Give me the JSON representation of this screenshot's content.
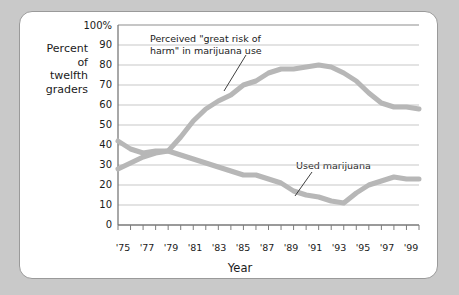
{
  "figure": {
    "card_background": "#ffffff",
    "outer_background": "#c9c9c9",
    "border_color": "#9a9a9a"
  },
  "axis": {
    "y_title": "Percent\nof\ntwelfth\ngraders",
    "x_title": "Year",
    "y_tick_labels": [
      "100%",
      "90",
      "80",
      "70",
      "60",
      "50",
      "40",
      "30",
      "20",
      "10",
      "0"
    ],
    "x_tick_labels": [
      "'75",
      "'77",
      "'79",
      "'81",
      "'83",
      "'85",
      "'87",
      "'89",
      "'91",
      "'93",
      "'95",
      "'97",
      "'99"
    ]
  },
  "annotations": {
    "risk": "Perceived \"great risk of\nharm\" in marijuana use",
    "used": "Used marijuana"
  },
  "chart_data": {
    "type": "line",
    "title": "",
    "subtitle": "",
    "xlabel": "Year",
    "ylabel": "Percent of twelfth graders",
    "xlim": [
      1975,
      1999
    ],
    "ylim": [
      0,
      100
    ],
    "grid": true,
    "grid_axis": "y",
    "legend_position": "none",
    "annotations_as_labels": true,
    "line_color": "#b7b7b7",
    "line_width_px": 5,
    "x": [
      1975,
      1976,
      1977,
      1978,
      1979,
      1980,
      1981,
      1982,
      1983,
      1984,
      1985,
      1986,
      1987,
      1988,
      1989,
      1990,
      1991,
      1992,
      1993,
      1994,
      1995,
      1996,
      1997,
      1998,
      1999
    ],
    "series": [
      {
        "name": "Perceived \"great risk of harm\" in marijuana use",
        "label": "Perceived \"great risk of harm\" in marijuana use",
        "values": [
          28,
          31,
          34,
          36,
          37,
          44,
          52,
          58,
          62,
          65,
          70,
          72,
          76,
          78,
          78,
          79,
          80,
          79,
          76,
          72,
          66,
          61,
          59,
          59,
          58
        ]
      },
      {
        "name": "Used marijuana",
        "label": "Used marijuana",
        "values": [
          42,
          38,
          36,
          37,
          37,
          35,
          33,
          31,
          29,
          27,
          25,
          25,
          23,
          21,
          17,
          15,
          14,
          12,
          11,
          16,
          20,
          22,
          24,
          23,
          23
        ]
      }
    ]
  }
}
